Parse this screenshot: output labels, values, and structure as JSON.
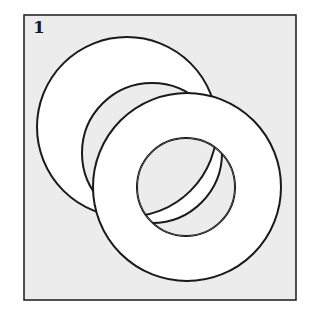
{
  "figure": {
    "label": "1",
    "background_color": "#ececec",
    "ring_fill": "#ffffff",
    "stroke_color": "#1a1a1a",
    "shapes": [
      {
        "name": "back-ring",
        "outer": {
          "cx": 127,
          "cy": 127,
          "r": 90
        },
        "inner": {
          "cx": 152,
          "cy": 153,
          "r": 70
        }
      },
      {
        "name": "front-ring",
        "outer": {
          "cx": 187,
          "cy": 187,
          "r": 94
        },
        "inner": {
          "cx": 186,
          "cy": 187,
          "r": 49
        }
      }
    ]
  }
}
